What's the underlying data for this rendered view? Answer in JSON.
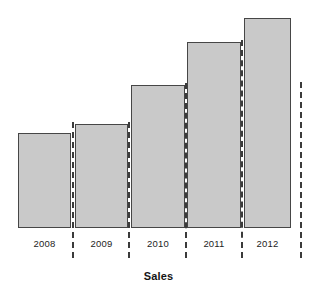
{
  "chart_data": {
    "type": "bar",
    "title": "",
    "xlabel": "Sales",
    "ylabel": "",
    "categories": [
      "2008",
      "2009",
      "2010",
      "2011",
      "2012"
    ],
    "values": [
      95,
      104,
      143,
      186,
      210
    ],
    "ylim": [
      0,
      222
    ],
    "grid": false,
    "legend": null,
    "annotations": [],
    "axis_tick_labels": [
      "2008",
      "2009",
      "2010",
      "2011",
      "2012"
    ],
    "separators_visible": true,
    "bar_fill_color": "#c9c9c9",
    "bar_border_color": "#464646",
    "separator_color": "#3b3b3b",
    "text_color": "#1d1d1d",
    "background_color": "#ffffff"
  },
  "chart": {
    "axis_title": "Sales",
    "bars": [
      {
        "label": "2008",
        "value": 95,
        "left": 18,
        "width": 53,
        "top": 133,
        "height": 95
      },
      {
        "label": "2009",
        "value": 104,
        "left": 75,
        "width": 53,
        "top": 124,
        "height": 104
      },
      {
        "label": "2010",
        "value": 143,
        "left": 131,
        "width": 54,
        "top": 85,
        "height": 143
      },
      {
        "label": "2011",
        "value": 186,
        "left": 187,
        "width": 54,
        "top": 42,
        "height": 186
      },
      {
        "label": "2012",
        "value": 210,
        "left": 244,
        "width": 47,
        "top": 18,
        "height": 210
      }
    ],
    "separators": [
      {
        "x": 72,
        "top": 122,
        "height": 136
      },
      {
        "x": 128,
        "top": 122,
        "height": 136
      },
      {
        "x": 185,
        "top": 83,
        "height": 175
      },
      {
        "x": 241,
        "top": 40,
        "height": 218
      },
      {
        "x": 300,
        "top": 82,
        "height": 176
      }
    ],
    "tick_labels": [
      {
        "text": "2008",
        "left": 18,
        "width": 53,
        "top": 238
      },
      {
        "text": "2009",
        "left": 75,
        "width": 53,
        "top": 238
      },
      {
        "text": "2010",
        "left": 131,
        "width": 54,
        "top": 238
      },
      {
        "text": "2011",
        "left": 187,
        "width": 54,
        "top": 238
      },
      {
        "text": "2012",
        "left": 244,
        "width": 47,
        "top": 238
      }
    ]
  }
}
